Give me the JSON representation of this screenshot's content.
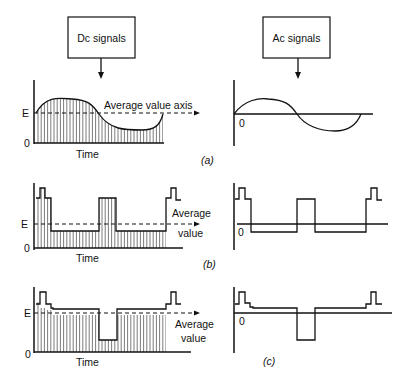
{
  "boxes": {
    "dc": "Dc signals",
    "ac": "Ac signals"
  },
  "labels": {
    "E": "E",
    "zero": "0",
    "time": "Time",
    "avg_axis": "Average value axis",
    "average": "Average",
    "value": "value",
    "panel_a_open": "(",
    "panel_a": "a",
    "panel_a_close": ")",
    "panel_b": "b",
    "panel_c": "c"
  },
  "panels": [
    {
      "id": "a",
      "dc_waveform": "sinusoid offset by E, shaded area",
      "ac_waveform": "sinusoid about 0"
    },
    {
      "id": "b",
      "dc_waveform": "pulse train offset, average E",
      "ac_waveform": "pulse train about 0"
    },
    {
      "id": "c",
      "dc_waveform": "pulse train with negative notch, average E",
      "ac_waveform": "pulse train with negative notch about 0"
    }
  ],
  "colors": {
    "ink": "#111111",
    "background": "#ffffff"
  }
}
